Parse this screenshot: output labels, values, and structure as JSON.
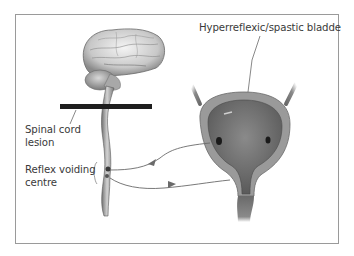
{
  "diagram": {
    "labels": {
      "bladder": "Hyperreflexic/spastic bladde",
      "lesion_line1": "Spinal cord",
      "lesion_line2": "lesion",
      "reflex_line1": "Reflex voiding",
      "reflex_line2": "centre"
    },
    "elements": [
      {
        "name": "brain",
        "type": "illustration"
      },
      {
        "name": "spinal-cord",
        "type": "illustration"
      },
      {
        "name": "lesion-bar",
        "type": "black horizontal bar across spinal cord"
      },
      {
        "name": "bladder",
        "type": "cross-section illustration with ureters"
      },
      {
        "name": "afferent-arrow",
        "from": "bladder",
        "to": "reflex voiding centre"
      },
      {
        "name": "efferent-arrow",
        "from": "reflex voiding centre",
        "to": "bladder neck"
      }
    ],
    "colors": {
      "frame": "#9a9a9a",
      "text": "#3a3a3a",
      "lesion_bar": "#1e1e1e",
      "arrows": "#6a6a6a"
    }
  }
}
